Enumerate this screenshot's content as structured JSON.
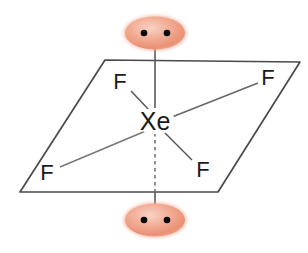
{
  "diagram": {
    "background_color": "#ffffff",
    "line_color": "#3d3d3d",
    "plane_line_color": "#555555",
    "label_color": "#1a1a1a",
    "lone_pair_fill": "#f0a089",
    "lone_pair_highlight": "#f6c9b8",
    "lone_pair_dot_color": "#000000",
    "central_atom": {
      "name": "central-atom-xenon",
      "label": "Xe",
      "x": 155,
      "y": 122
    },
    "ligands": [
      {
        "name": "fluorine-top-left",
        "label": "F",
        "x": 120,
        "y": 81,
        "bond_from": [
          150,
          111
        ],
        "bond_to": [
          131,
          91
        ]
      },
      {
        "name": "fluorine-top-right",
        "label": "F",
        "x": 268,
        "y": 77,
        "bond_from": [
          172,
          117
        ],
        "bond_to": [
          258,
          83
        ]
      },
      {
        "name": "fluorine-bottom-left",
        "label": "F",
        "x": 47,
        "y": 172,
        "bond_from": [
          148,
          130
        ],
        "bond_to": [
          60,
          167
        ]
      },
      {
        "name": "fluorine-bottom-right",
        "label": "F",
        "x": 203,
        "y": 169,
        "bond_from": [
          165,
          133
        ],
        "bond_to": [
          192,
          160
        ]
      }
    ],
    "lone_pairs": [
      {
        "name": "lone-pair-top",
        "cx": 155,
        "cy": 33,
        "rx": 31,
        "ry": 17,
        "dots": [
          {
            "cx": 144,
            "cy": 33
          },
          {
            "cx": 167,
            "cy": 33
          }
        ]
      },
      {
        "name": "lone-pair-bottom",
        "cx": 155,
        "cy": 220,
        "rx": 31,
        "ry": 17,
        "dots": [
          {
            "cx": 144,
            "cy": 220
          },
          {
            "cx": 167,
            "cy": 220
          }
        ]
      }
    ],
    "axial_bonds": [
      {
        "name": "axial-bond-up",
        "style": "solid",
        "x1": 155,
        "y1": 34,
        "x2": 155,
        "y2": 110
      },
      {
        "name": "axial-bond-down-dashed",
        "style": "dashed",
        "x1": 155,
        "y1": 133,
        "x2": 155,
        "y2": 192
      },
      {
        "name": "axial-bond-down-solid",
        "style": "solid",
        "x1": 155,
        "y1": 192,
        "x2": 155,
        "y2": 219
      }
    ],
    "plane": {
      "name": "square-planar-plane",
      "points": "105,60 300,62 218,192 20,192"
    }
  }
}
